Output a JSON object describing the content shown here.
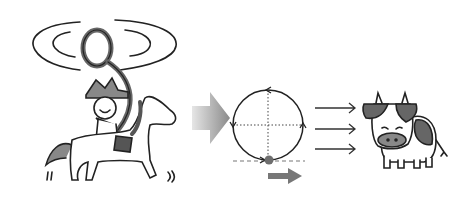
{
  "diagram": {
    "panels": [
      {
        "id": "cowboy-on-horse",
        "label": ""
      },
      {
        "id": "circular-motion",
        "label": ""
      },
      {
        "id": "cow",
        "label": ""
      }
    ],
    "colors": {
      "ink": "#222222",
      "gray_fill": "#7a7a7a",
      "dark_fill": "#555555",
      "arrow_big": "#8a8a8a",
      "dot": "#6e6e6e",
      "background": "#ffffff"
    }
  }
}
